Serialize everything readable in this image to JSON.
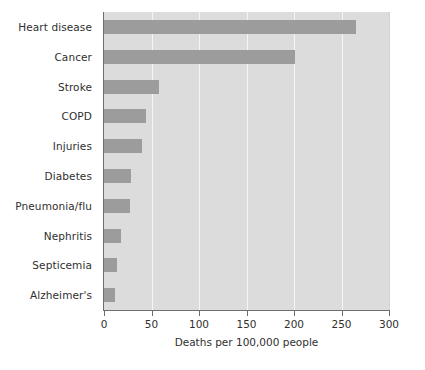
{
  "chart_data": {
    "type": "bar",
    "orientation": "horizontal",
    "title": "",
    "xlabel": "Deaths per 100,000 people",
    "ylabel": "",
    "categories": [
      "Heart disease",
      "Cancer",
      "Stroke",
      "COPD",
      "Injuries",
      "Diabetes",
      "Pneumonia/flu",
      "Nephritis",
      "Septicemia",
      "Alzheimer's"
    ],
    "values": [
      265,
      201,
      58,
      44,
      40,
      28,
      27,
      18,
      14,
      12
    ],
    "xlim": [
      0,
      300
    ],
    "xticks": [
      0,
      50,
      100,
      150,
      200,
      250,
      300
    ],
    "xtick_labels": [
      "0",
      "50",
      "100",
      "150",
      "200",
      "250",
      "300"
    ],
    "grid": "vertical-white",
    "legend": null,
    "colors": {
      "bar": "#9c9c9c",
      "plot_background": "#dcdcdc",
      "gridline": "#f4f4f4",
      "axis": "#6e6e6e",
      "text": "#2f2f2f",
      "figure_background": "#ffffff"
    }
  }
}
